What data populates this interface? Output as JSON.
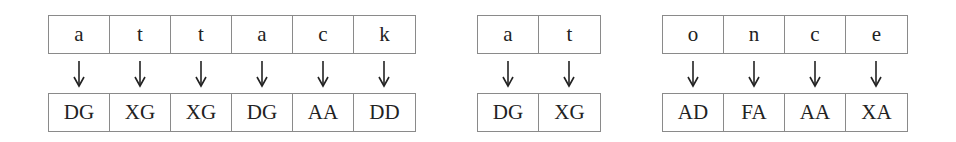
{
  "groups": [
    {
      "id": "attack",
      "left": 48,
      "plaintext": [
        "a",
        "t",
        "t",
        "a",
        "c",
        "k"
      ],
      "ciphertext": [
        "DG",
        "XG",
        "XG",
        "DG",
        "AA",
        "DD"
      ]
    },
    {
      "id": "at",
      "left": 477,
      "plaintext": [
        "a",
        "t"
      ],
      "ciphertext": [
        "DG",
        "XG"
      ]
    },
    {
      "id": "once",
      "left": 662,
      "plaintext": [
        "o",
        "n",
        "c",
        "e"
      ],
      "ciphertext": [
        "AD",
        "FA",
        "AA",
        "XA"
      ]
    }
  ],
  "arrow_icon": "down-arrow-icon",
  "colors": {
    "border": "#8a8a8a",
    "text": "#222222"
  }
}
